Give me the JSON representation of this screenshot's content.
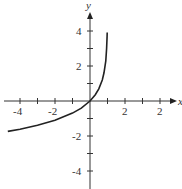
{
  "chart_data": {
    "type": "line",
    "title": "",
    "xlabel": "x",
    "ylabel": "y",
    "xlim": [
      -5,
      5
    ],
    "ylim": [
      -5,
      5
    ],
    "x_ticks": [
      -4,
      -3,
      -2,
      -1,
      1,
      2,
      3,
      4
    ],
    "y_ticks": [
      -4,
      -3,
      -2,
      -1,
      1,
      2,
      3,
      4
    ],
    "x_tick_labels": [
      {
        "x": -4,
        "text": "-4"
      },
      {
        "x": -2,
        "text": "-2"
      },
      {
        "x": 2,
        "text": "2"
      },
      {
        "x": 4,
        "text": "2"
      }
    ],
    "y_tick_labels": [
      {
        "y": 4,
        "text": "4"
      },
      {
        "y": 2,
        "text": "2"
      },
      {
        "y": -2,
        "text": "-2"
      },
      {
        "y": -4,
        "text": "-4"
      }
    ],
    "grid": false,
    "legend": null,
    "series": [
      {
        "name": "y = -ln(1 - x)",
        "color": "#222222",
        "x": [
          -4.7,
          -4,
          -3,
          -2,
          -1,
          -0.5,
          0,
          0.3,
          0.5,
          0.7,
          0.8,
          0.9,
          0.95,
          0.975,
          0.98
        ],
        "y": [
          -1.74,
          -1.61,
          -1.39,
          -1.1,
          -0.69,
          -0.41,
          0,
          0.36,
          0.69,
          1.2,
          1.61,
          2.3,
          3.0,
          3.69,
          3.91
        ]
      }
    ]
  },
  "labels": {
    "x_axis": "x",
    "y_axis": "y",
    "xt_m4": "-4",
    "xt_m2": "-2",
    "xt_p2": "2",
    "xt_p4": "2",
    "yt_p4": "4",
    "yt_p2": "2",
    "yt_m2": "-2",
    "yt_m4": "-4"
  }
}
